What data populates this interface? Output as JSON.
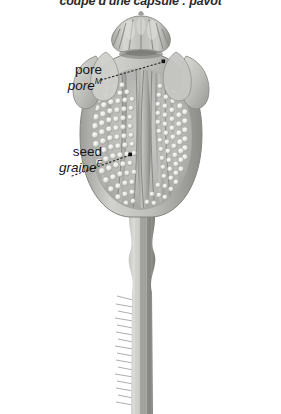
{
  "title": "coupe d'une capsule : pavot",
  "diagram": {
    "background_color": "#ffffff",
    "ink_color": "#1c1c1c",
    "palette": {
      "outer_wall_light": "#d8d8d6",
      "outer_wall_mid": "#b5b5b2",
      "outer_wall_dark": "#8f8f8c",
      "inner_septa": "#9a9a97",
      "seed_light": "#f2f2f0",
      "seed_shadow": "#a9a9a6",
      "stem_light": "#cfcfcd",
      "stem_dark": "#7d7d7a",
      "outline": "#6e6e6b"
    }
  },
  "labels": [
    {
      "id": "pore",
      "english": "pore",
      "french": "pore",
      "gender": "M"
    },
    {
      "id": "seed",
      "english": "seed",
      "french": "graine",
      "gender": "F"
    }
  ]
}
